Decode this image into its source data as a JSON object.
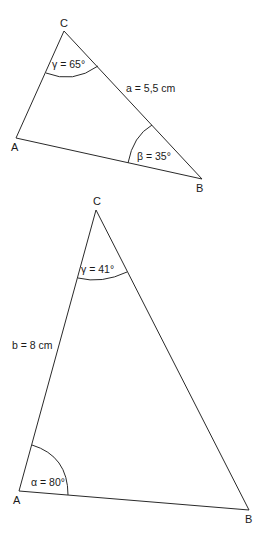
{
  "triangles": [
    {
      "vertices": {
        "A": {
          "label": "A",
          "x": 16,
          "y": 138
        },
        "B": {
          "label": "B",
          "x": 202,
          "y": 179
        },
        "C": {
          "label": "C",
          "x": 64,
          "y": 31
        }
      },
      "measures": {
        "gamma": "γ = 65°",
        "side_a": "a = 5,5 cm",
        "beta": "β = 35°"
      }
    },
    {
      "vertices": {
        "A": {
          "label": "A",
          "x": 19,
          "y": 491
        },
        "B": {
          "label": "B",
          "x": 249,
          "y": 510
        },
        "C": {
          "label": "C",
          "x": 96,
          "y": 210
        }
      },
      "measures": {
        "gamma": "γ = 41°",
        "side_b": "b = 8 cm",
        "alpha": "α = 80°"
      }
    }
  ]
}
